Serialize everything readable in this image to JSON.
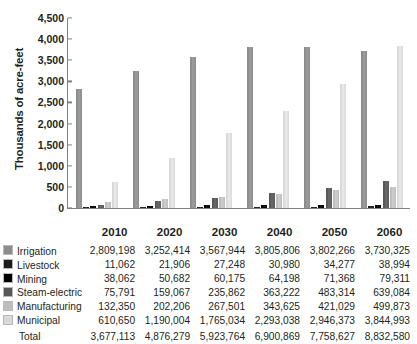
{
  "chart_data": {
    "type": "bar",
    "title": "",
    "xlabel": "",
    "ylabel": "Thousands of acre-feet",
    "categories": [
      "2010",
      "2020",
      "2030",
      "2040",
      "2050",
      "2060"
    ],
    "ylim": [
      0,
      4500
    ],
    "ytick_step": 500,
    "yticks": [
      "0",
      "500",
      "1,000",
      "1,500",
      "2,000",
      "2,500",
      "3,000",
      "3,500",
      "4,000",
      "4,500"
    ],
    "ytick_values": [
      0,
      500,
      1000,
      1500,
      2000,
      2500,
      3000,
      3500,
      4000,
      4500
    ],
    "grid": false,
    "legend_position": "table-left",
    "units": "thousands of acre-feet",
    "note": "Bar heights are plotted in thousands of acre-feet; table values are in acre-feet.",
    "series": [
      {
        "name": "Irrigation",
        "color": "#8c8c8c",
        "values": [
          2809.198,
          3252.414,
          3567.944,
          3805.806,
          3802.266,
          3730.325
        ],
        "table_values": [
          "2,809,198",
          "3,252,414",
          "3,567,944",
          "3,805,806",
          "3,802,266",
          "3,730,325"
        ]
      },
      {
        "name": "Livestock",
        "color": "#1c1c1c",
        "values": [
          11.062,
          21.906,
          27.248,
          30.98,
          34.277,
          38.994
        ],
        "table_values": [
          "11,062",
          "21,906",
          "27,248",
          "30,980",
          "34,277",
          "38,994"
        ]
      },
      {
        "name": "Mining",
        "color": "#000000",
        "values": [
          38.062,
          50.682,
          60.175,
          64.198,
          71.368,
          79.311
        ],
        "table_values": [
          "38,062",
          "50,682",
          "60,175",
          "64,198",
          "71,368",
          "79,311"
        ]
      },
      {
        "name": "Steam-electric",
        "color": "#585858",
        "values": [
          75.791,
          159.067,
          235.862,
          363.222,
          483.314,
          639.084
        ],
        "table_values": [
          "75,791",
          "159,067",
          "235,862",
          "363,222",
          "483,314",
          "639,084"
        ]
      },
      {
        "name": "Manufacturing",
        "color": "#bdbdbd",
        "values": [
          132.35,
          202.206,
          267.501,
          343.625,
          421.029,
          499.873
        ],
        "table_values": [
          "132,350",
          "202,206",
          "267,501",
          "343,625",
          "421,029",
          "499,873"
        ]
      },
      {
        "name": "Municipal",
        "color": "#d9d9d9",
        "values": [
          610.65,
          1190.004,
          1765.034,
          2293.038,
          2946.373,
          3844.993
        ],
        "table_values": [
          "610,650",
          "1,190,004",
          "1,765,034",
          "2,293,038",
          "2,946,373",
          "3,844,993"
        ]
      }
    ],
    "total": {
      "label": "Total",
      "values": [
        3677.113,
        4876.279,
        5923.764,
        6900.869,
        7758.627,
        8832.58
      ],
      "table_values": [
        "3,677,113",
        "4,876,279",
        "5,923,764",
        "6,900,869",
        "7,758,627",
        "8,832,580"
      ]
    }
  }
}
